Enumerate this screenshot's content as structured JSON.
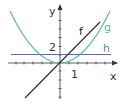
{
  "figure": {
    "axes": {
      "x_label": "x",
      "y_label": "y",
      "x_tick_label": "1",
      "y_tick_label": "2"
    },
    "functions": [
      {
        "name": "f",
        "label": "f",
        "expression": "f(x) = x",
        "color": "#2b2b2b"
      },
      {
        "name": "g",
        "label": "g",
        "expression": "g(x) = x^2 / 2",
        "color": "#5fb8a2"
      },
      {
        "name": "h",
        "label": "h",
        "expression": "h(x) = 1",
        "color": "#5d6f9e"
      }
    ],
    "colors": {
      "axis": "#333333",
      "label_f": "#222222",
      "label_g": "#5fb8a2",
      "label_h": "#5a8c88"
    }
  }
}
